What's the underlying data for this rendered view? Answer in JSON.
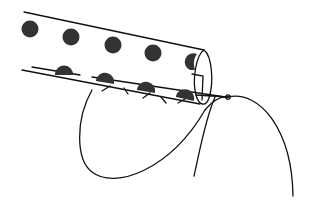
{
  "figure": {
    "elements": [
      "tube",
      "dots",
      "stitches",
      "needle",
      "thread"
    ],
    "dot_color": "#333333",
    "line_color": "#111111"
  }
}
